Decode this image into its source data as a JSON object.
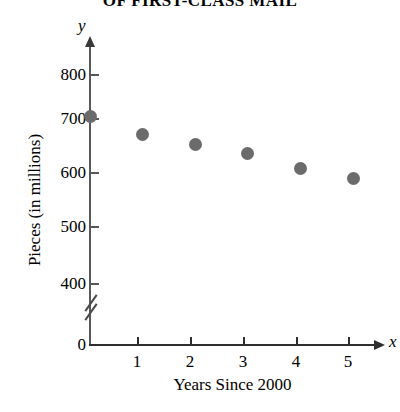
{
  "chart_data": {
    "type": "scatter",
    "title": "OF FIRST-CLASS MAIL",
    "xlabel": "Years Since 2000",
    "ylabel": "Pieces (in millions)",
    "x": [
      0,
      1,
      2,
      3,
      4,
      5
    ],
    "values": [
      703,
      670,
      651,
      635,
      606,
      588
    ],
    "x_tick_labels": [
      "1",
      "2",
      "3",
      "4",
      "5"
    ],
    "y_tick_labels": [
      "800",
      "700",
      "600",
      "500",
      "400",
      "0"
    ],
    "xlim": [
      0,
      5.6
    ],
    "ylim": [
      400,
      850
    ],
    "axis_break": true,
    "grid": false,
    "legend": "none",
    "y_axis_letter": "y",
    "x_axis_letter": "x",
    "origin_label": "0",
    "marker_color": "#6b6b6b",
    "axis_color": "#2e2e30",
    "points": [
      {
        "x": 0,
        "y": 703
      },
      {
        "x": 1,
        "y": 670
      },
      {
        "x": 2,
        "y": 651
      },
      {
        "x": 3,
        "y": 635
      },
      {
        "x": 4,
        "y": 606
      },
      {
        "x": 5,
        "y": 588
      }
    ]
  }
}
